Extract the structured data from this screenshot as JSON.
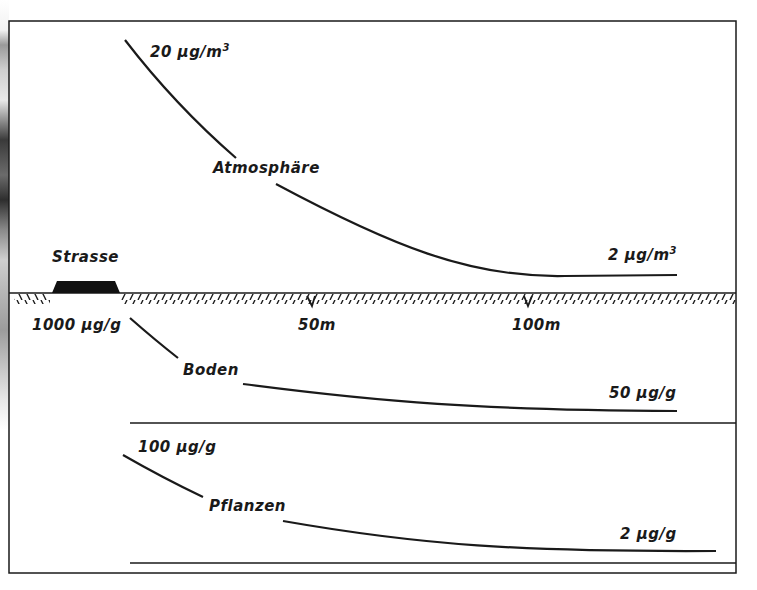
{
  "figure": {
    "road_label": "Strasse",
    "distance_ticks": [
      {
        "label": "50m",
        "x": 312
      },
      {
        "label": "100m",
        "x": 528
      }
    ],
    "panels": [
      {
        "name": "Atmosphäre",
        "label": "Atmosphäre",
        "start_value": "20 µg/m",
        "start_value_sup": "3",
        "end_value": "2 µg/m",
        "end_value_sup": "3"
      },
      {
        "name": "Boden",
        "label": "Boden",
        "start_value": "1000 µg/g",
        "end_value": "50 µg/g"
      },
      {
        "name": "Pflanzen",
        "label": "Pflanzen",
        "start_value": "100 µg/g",
        "end_value": "2 µg/g"
      }
    ],
    "colors": {
      "ink": "#1a1a1a",
      "paper": "#ffffff",
      "road": "#111111"
    }
  }
}
